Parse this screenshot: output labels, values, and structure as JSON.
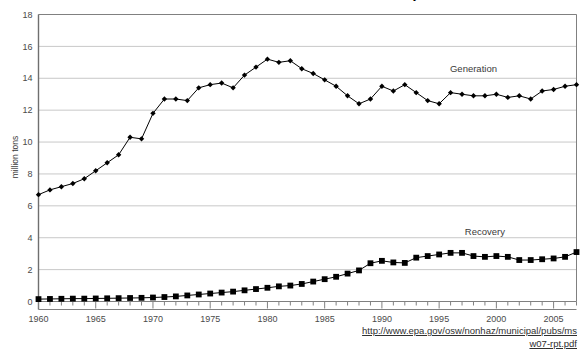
{
  "title": "Materials Generation and Recovery",
  "source_note": {
    "line1": "http://www.epa.gov/osw/nonhaz/municipal/pubs/ms",
    "line2": "w07-rpt.pdf",
    "full_url": "http://www.epa.gov/osw/nonhaz/municipal/pubs/msw07-rpt.pdf"
  },
  "labels": {
    "generation": "Generation",
    "recovery": "Recovery",
    "ylabel": "million tons"
  },
  "colors": {
    "line": "#000000",
    "grid": "#c8c8c8",
    "axis": "#808080",
    "text": "#3a3a3a"
  },
  "chart_data": {
    "type": "line",
    "title": "Materials Generation and Recovery",
    "xlabel": "",
    "ylabel": "million tons",
    "xlim": [
      1960,
      2007
    ],
    "ylim": [
      0,
      18
    ],
    "ytick_values": [
      0,
      2,
      4,
      6,
      8,
      10,
      12,
      14,
      16,
      18
    ],
    "xtick_values": [
      1960,
      1965,
      1970,
      1975,
      1980,
      1985,
      1990,
      1995,
      2000,
      2005
    ],
    "xtick_labels": [
      "1960",
      "1965",
      "1970",
      "1975",
      "1980",
      "1985",
      "1990",
      "1995",
      "2000",
      "2005"
    ],
    "ytick_labels": [
      "0",
      "2",
      "4",
      "6",
      "8",
      "10",
      "12",
      "14",
      "16",
      "18"
    ],
    "grid": true,
    "grid_axis": "y",
    "legend": "inline-annotation",
    "x": [
      1960,
      1961,
      1962,
      1963,
      1964,
      1965,
      1966,
      1967,
      1968,
      1969,
      1970,
      1971,
      1972,
      1973,
      1974,
      1975,
      1976,
      1977,
      1978,
      1979,
      1980,
      1981,
      1982,
      1983,
      1984,
      1985,
      1986,
      1987,
      1988,
      1989,
      1990,
      1991,
      1992,
      1993,
      1994,
      1995,
      1996,
      1997,
      1998,
      1999,
      2000,
      2001,
      2002,
      2003,
      2004,
      2005,
      2006,
      2007
    ],
    "series": [
      {
        "name": "Generation",
        "marker": "diamond",
        "values": [
          6.7,
          7.0,
          7.2,
          7.4,
          7.7,
          8.2,
          8.7,
          9.2,
          10.3,
          10.2,
          11.8,
          12.7,
          12.7,
          12.6,
          13.4,
          13.6,
          13.7,
          13.4,
          14.2,
          14.7,
          15.2,
          15.0,
          15.1,
          14.6,
          14.3,
          13.9,
          13.5,
          12.9,
          12.4,
          12.7,
          13.5,
          13.2,
          13.6,
          13.1,
          12.6,
          12.4,
          13.1,
          13.0,
          12.9,
          12.9,
          13.0,
          12.8,
          12.9,
          12.7,
          13.2,
          13.3,
          13.5,
          13.6
        ]
      },
      {
        "name": "Recovery",
        "marker": "square",
        "values": [
          0.15,
          0.16,
          0.17,
          0.18,
          0.18,
          0.19,
          0.2,
          0.21,
          0.22,
          0.23,
          0.25,
          0.28,
          0.32,
          0.38,
          0.44,
          0.5,
          0.56,
          0.62,
          0.7,
          0.78,
          0.86,
          0.95,
          1.0,
          1.1,
          1.25,
          1.4,
          1.55,
          1.75,
          1.95,
          2.4,
          2.55,
          2.45,
          2.42,
          2.75,
          2.85,
          2.95,
          3.05,
          3.05,
          2.85,
          2.8,
          2.85,
          2.8,
          2.6,
          2.6,
          2.65,
          2.7,
          2.8,
          3.1
        ]
      }
    ],
    "annotations": [
      {
        "text": "Generation",
        "x": 1998,
        "y": 14.4
      },
      {
        "text": "Recovery",
        "x": 1999,
        "y": 4.2
      }
    ]
  }
}
